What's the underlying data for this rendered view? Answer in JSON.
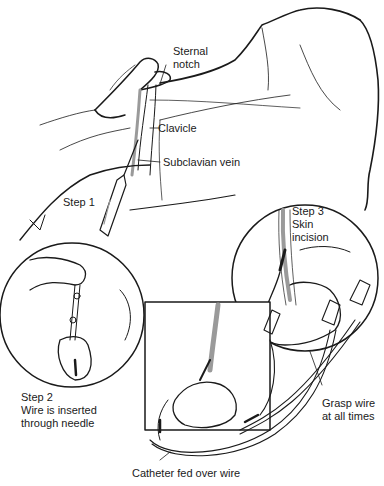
{
  "labels": {
    "sternal_notch": [
      "Sternal",
      "notch"
    ],
    "clavicle": "Clavicle",
    "subclavian_vein": "Subclavian vein",
    "step1": "Step 1",
    "step3": [
      "Step 3",
      "Skin",
      "incision"
    ],
    "step2": [
      "Step 2",
      "Wire is inserted",
      "through needle"
    ],
    "grasp": [
      "Grasp wire",
      "at all times"
    ],
    "catheter": "Catheter fed over wire"
  },
  "colors": {
    "line": "#1a1a1a",
    "shade": "#9a9a9a",
    "background": "#ffffff"
  }
}
